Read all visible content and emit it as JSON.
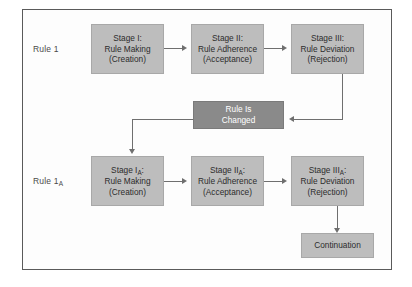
{
  "diagram": {
    "colors": {
      "box_fill": "#bdbdbd",
      "box_highlight_fill": "#8a8a8a",
      "connector": "#6f6f6f",
      "frame_border": "#5a5a5a",
      "text": "#2c2c2c",
      "highlight_text": "#ffffff"
    },
    "row_labels": [
      {
        "text": "Rule 1",
        "sub": ""
      },
      {
        "text": "Rule 1",
        "sub": "A"
      }
    ],
    "nodes": [
      {
        "id": "stage-1",
        "line1": "Stage I:",
        "line1_sub": "",
        "line2": "Rule Making",
        "line3": "(Creation)"
      },
      {
        "id": "stage-2",
        "line1": "Stage II:",
        "line1_sub": "",
        "line2": "Rule Adherence",
        "line3": "(Acceptance)"
      },
      {
        "id": "stage-3",
        "line1": "Stage III:",
        "line1_sub": "",
        "line2": "Rule Deviation",
        "line3": "(Rejection)"
      },
      {
        "id": "rule-is-changed",
        "line1": "Rule Is",
        "line1_sub": "",
        "line2": "Changed",
        "line3": ""
      },
      {
        "id": "stage-1a",
        "line1": "Stage I",
        "line1_sub": "A",
        "line1_suffix": ":",
        "line2": "Rule Making",
        "line3": "(Creation)"
      },
      {
        "id": "stage-2a",
        "line1": "Stage II",
        "line1_sub": "A",
        "line1_suffix": ":",
        "line2": "Rule Adherence",
        "line3": "(Acceptance)"
      },
      {
        "id": "stage-3a",
        "line1": "Stage III",
        "line1_sub": "A",
        "line1_suffix": ":",
        "line2": "Rule Deviation",
        "line3": "(Rejection)"
      },
      {
        "id": "continuation",
        "line1": "Continuation",
        "line1_sub": "",
        "line2": "",
        "line3": ""
      }
    ]
  }
}
